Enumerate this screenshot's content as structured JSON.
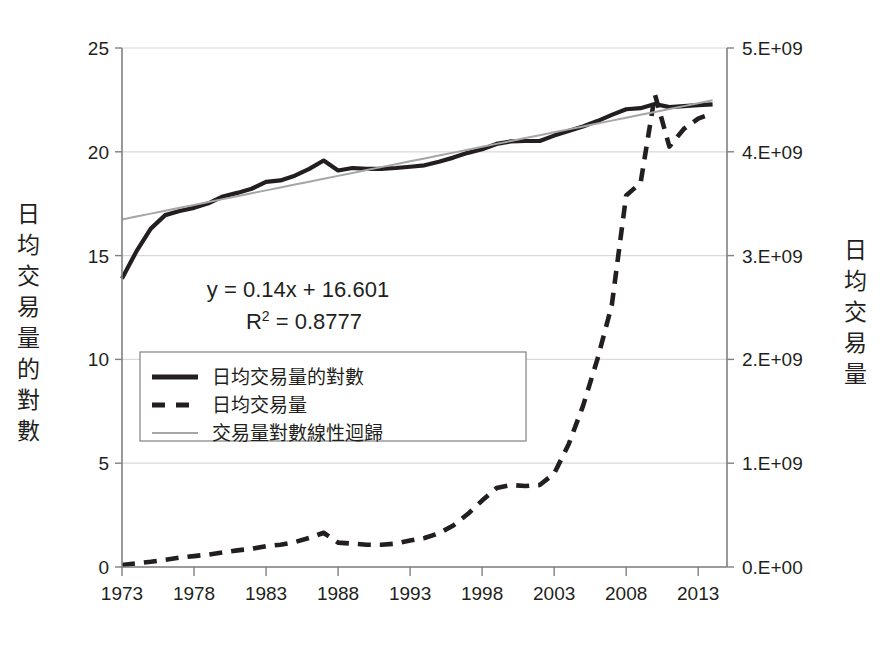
{
  "chart_data": {
    "type": "line",
    "title": "",
    "xlabel": "",
    "ylabel": "日均交易量的對數",
    "y2label": "日均交易量",
    "grid": true,
    "legend_position": "inside-left",
    "xlim": [
      1973,
      2015
    ],
    "ylim": [
      0,
      25
    ],
    "y2lim": [
      0,
      5000000000
    ],
    "xticks": [
      "1973",
      "1978",
      "1983",
      "1988",
      "1993",
      "1998",
      "2003",
      "2008",
      "2013"
    ],
    "xtick_values": [
      1973,
      1978,
      1983,
      1988,
      1993,
      1998,
      2003,
      2008,
      2013
    ],
    "yticks": [
      "0",
      "5",
      "10",
      "15",
      "20",
      "25"
    ],
    "ytick_values": [
      0,
      5,
      10,
      15,
      20,
      25
    ],
    "y2ticks": [
      "0.E+00",
      "1.E+09",
      "2.E+09",
      "3.E+09",
      "4.E+09",
      "5.E+09"
    ],
    "y2tick_values": [
      0,
      1000000000,
      2000000000,
      3000000000,
      4000000000,
      5000000000
    ],
    "annotations": {
      "equation": "y = 0.14x + 16.601",
      "r_squared_prefix": "R",
      "r_squared_sup": "2",
      "r_squared_value": " = 0.8777"
    },
    "legend": [
      {
        "label": "日均交易量的對數",
        "style": "solid-thick",
        "color": "#231f20"
      },
      {
        "label": "日均交易量",
        "style": "dashed-thick",
        "color": "#231f20"
      },
      {
        "label": "交易量對數線性迴歸",
        "style": "solid-thin",
        "color": "#a6a6a6"
      }
    ],
    "x": [
      1973,
      1974,
      1975,
      1976,
      1977,
      1978,
      1979,
      1980,
      1981,
      1982,
      1983,
      1984,
      1985,
      1986,
      1987,
      1988,
      1989,
      1990,
      1991,
      1992,
      1993,
      1994,
      1995,
      1996,
      1997,
      1998,
      1999,
      2000,
      2001,
      2002,
      2003,
      2004,
      2005,
      2006,
      2007,
      2008,
      2009,
      2010,
      2011,
      2012,
      2013,
      2014
    ],
    "series": [
      {
        "name": "日均交易量的對數",
        "axis": "left",
        "style": "solid-thick",
        "color": "#231f20",
        "values": [
          13.9,
          15.2,
          16.3,
          16.95,
          17.15,
          17.3,
          17.52,
          17.85,
          18.02,
          18.22,
          18.55,
          18.62,
          18.85,
          19.18,
          19.58,
          19.1,
          19.22,
          19.18,
          19.18,
          19.22,
          19.28,
          19.35,
          19.52,
          19.72,
          19.95,
          20.12,
          20.38,
          20.5,
          20.52,
          20.52,
          20.78,
          21.0,
          21.22,
          21.48,
          21.78,
          22.05,
          22.1,
          22.3,
          22.15,
          22.2,
          22.25,
          22.28
        ]
      },
      {
        "name": "日均交易量",
        "axis": "right",
        "style": "dashed-thick",
        "color": "#231f20",
        "values": [
          20000000,
          35000000,
          50000000,
          70000000,
          90000000,
          105000000,
          120000000,
          140000000,
          160000000,
          175000000,
          200000000,
          215000000,
          240000000,
          280000000,
          330000000,
          235000000,
          225000000,
          215000000,
          215000000,
          225000000,
          255000000,
          280000000,
          325000000,
          400000000,
          510000000,
          640000000,
          760000000,
          790000000,
          780000000,
          790000000,
          900000000,
          1180000000,
          1550000000,
          2000000000,
          2520000000,
          3580000000,
          3700000000,
          4550000000,
          4050000000,
          4220000000,
          4320000000,
          4370000000
        ]
      },
      {
        "name": "交易量對數線性迴歸",
        "axis": "left",
        "style": "solid-thin",
        "color": "#a6a6a6",
        "values": [
          16.741,
          16.881,
          17.021,
          17.161,
          17.301,
          17.441,
          17.581,
          17.721,
          17.861,
          18.001,
          18.141,
          18.281,
          18.421,
          18.561,
          18.701,
          18.841,
          18.981,
          19.121,
          19.261,
          19.401,
          19.541,
          19.681,
          19.821,
          19.961,
          20.101,
          20.241,
          20.381,
          20.521,
          20.661,
          20.801,
          20.941,
          21.081,
          21.221,
          21.361,
          21.501,
          21.641,
          21.781,
          21.921,
          22.061,
          22.201,
          22.341,
          22.481
        ]
      }
    ]
  },
  "colors": {
    "line_primary": "#231f20",
    "line_trend": "#a6a6a6",
    "grid": "#d9d9d9",
    "axis": "#808080",
    "legend_border": "#808080",
    "background": "#ffffff"
  }
}
